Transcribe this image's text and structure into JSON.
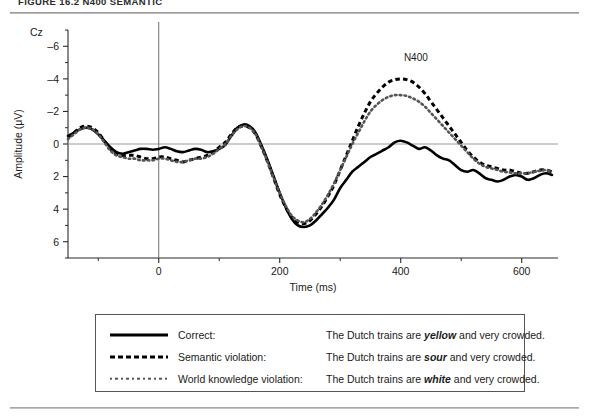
{
  "figure": {
    "caption": "FIGURE 16.2    N400 SEMANTIC",
    "channel_label": "Cz",
    "annotation": "N400"
  },
  "legend": {
    "rows": [
      {
        "style": "solid",
        "name": "Correct:",
        "sentence_pre": "The Dutch trains are ",
        "sentence_em": "yellow",
        "sentence_post": " and very crowded."
      },
      {
        "style": "dashed",
        "name": "Semantic violation:",
        "sentence_pre": "The Dutch trains are ",
        "sentence_em": "sour",
        "sentence_post": " and very crowded."
      },
      {
        "style": "dotted",
        "name": "World knowledge violation:",
        "sentence_pre": "The Dutch trains are ",
        "sentence_em": "white",
        "sentence_post": " and very crowded."
      }
    ]
  },
  "chart_data": {
    "type": "line",
    "title": "",
    "xlabel": "Time (ms)",
    "ylabel": "Amplitude (μV)",
    "xlim": [
      -150,
      660
    ],
    "ylim": [
      7,
      -7
    ],
    "y_inverted": true,
    "grid": false,
    "legend_position": "below-plot",
    "xticks": [
      0,
      200,
      400,
      600
    ],
    "xticks_minor": [
      -100,
      100,
      300,
      500
    ],
    "yticks": [
      -6,
      -4,
      -2,
      0,
      2,
      4,
      6
    ],
    "yticks_minor": [
      -7,
      -5,
      -3,
      -1,
      1,
      3,
      5,
      7
    ],
    "annotations": [
      {
        "text": "N400",
        "x": 425,
        "y": -5.1
      },
      {
        "text": "Cz",
        "x": -148,
        "y": -6.9
      }
    ],
    "zero_baseline": 0,
    "stimulus_onset_line": 0,
    "series": [
      {
        "name": "Correct",
        "style": "solid",
        "color": "#000000",
        "x": [
          -150,
          -140,
          -130,
          -120,
          -110,
          -100,
          -90,
          -80,
          -70,
          -60,
          -50,
          -40,
          -30,
          -20,
          -10,
          0,
          10,
          20,
          30,
          40,
          50,
          60,
          70,
          80,
          90,
          100,
          110,
          120,
          130,
          140,
          150,
          160,
          170,
          180,
          190,
          200,
          210,
          220,
          230,
          240,
          250,
          260,
          270,
          280,
          290,
          300,
          310,
          320,
          330,
          340,
          350,
          360,
          370,
          380,
          390,
          400,
          410,
          420,
          430,
          440,
          450,
          460,
          470,
          480,
          490,
          500,
          510,
          520,
          530,
          540,
          550,
          560,
          570,
          580,
          590,
          600,
          610,
          620,
          630,
          640,
          650
        ],
        "values": [
          -0.5,
          -0.7,
          -0.9,
          -1.0,
          -0.9,
          -0.6,
          -0.2,
          0.2,
          0.5,
          0.6,
          0.5,
          0.4,
          0.3,
          0.3,
          0.35,
          0.3,
          0.2,
          0.3,
          0.45,
          0.5,
          0.4,
          0.3,
          0.35,
          0.5,
          0.45,
          0.3,
          0.05,
          -0.5,
          -1.0,
          -1.2,
          -1.1,
          -0.7,
          0.1,
          1.0,
          2.0,
          3.0,
          3.9,
          4.6,
          5.0,
          5.1,
          5.0,
          4.7,
          4.3,
          3.9,
          3.4,
          2.7,
          2.2,
          1.7,
          1.4,
          1.1,
          0.8,
          0.6,
          0.4,
          0.2,
          -0.1,
          -0.2,
          -0.1,
          0.1,
          0.3,
          0.2,
          0.4,
          0.7,
          0.9,
          1.0,
          1.3,
          1.6,
          1.7,
          1.6,
          1.8,
          2.1,
          2.2,
          2.3,
          2.2,
          2.0,
          1.9,
          2.0,
          2.2,
          2.1,
          1.9,
          1.8,
          1.9
        ]
      },
      {
        "name": "Semantic violation",
        "style": "dashed",
        "color": "#000000",
        "x": [
          -150,
          -140,
          -130,
          -120,
          -110,
          -100,
          -90,
          -80,
          -70,
          -60,
          -50,
          -40,
          -30,
          -20,
          -10,
          0,
          10,
          20,
          30,
          40,
          50,
          60,
          70,
          80,
          90,
          100,
          110,
          120,
          130,
          140,
          150,
          160,
          170,
          180,
          190,
          200,
          210,
          220,
          230,
          240,
          250,
          260,
          270,
          280,
          290,
          300,
          310,
          320,
          330,
          340,
          350,
          360,
          370,
          380,
          390,
          400,
          410,
          420,
          430,
          440,
          450,
          460,
          470,
          480,
          490,
          500,
          510,
          520,
          530,
          540,
          550,
          560,
          570,
          580,
          590,
          600,
          610,
          620,
          630,
          640,
          650
        ],
        "values": [
          -0.4,
          -0.7,
          -1.0,
          -1.1,
          -1.0,
          -0.7,
          -0.2,
          0.3,
          0.6,
          0.7,
          0.7,
          0.7,
          0.8,
          0.9,
          0.9,
          0.8,
          0.8,
          0.9,
          1.0,
          1.1,
          1.0,
          0.9,
          0.8,
          0.7,
          0.5,
          0.2,
          -0.1,
          -0.6,
          -1.0,
          -1.1,
          -1.0,
          -0.6,
          0.2,
          1.1,
          2.1,
          3.1,
          3.9,
          4.5,
          4.8,
          4.9,
          4.7,
          4.3,
          3.8,
          3.2,
          2.5,
          1.6,
          0.7,
          -0.2,
          -1.1,
          -1.9,
          -2.6,
          -3.1,
          -3.5,
          -3.8,
          -3.95,
          -4.0,
          -3.95,
          -3.8,
          -3.5,
          -3.1,
          -2.6,
          -2.1,
          -1.6,
          -1.1,
          -0.6,
          -0.1,
          0.4,
          0.8,
          1.1,
          1.3,
          1.4,
          1.5,
          1.6,
          1.6,
          1.7,
          1.8,
          1.8,
          1.7,
          1.6,
          1.6,
          1.7
        ]
      },
      {
        "name": "World knowledge violation",
        "style": "dotted",
        "color": "#555555",
        "x": [
          -150,
          -140,
          -130,
          -120,
          -110,
          -100,
          -90,
          -80,
          -70,
          -60,
          -50,
          -40,
          -30,
          -20,
          -10,
          0,
          10,
          20,
          30,
          40,
          50,
          60,
          70,
          80,
          90,
          100,
          110,
          120,
          130,
          140,
          150,
          160,
          170,
          180,
          190,
          200,
          210,
          220,
          230,
          240,
          250,
          260,
          270,
          280,
          290,
          300,
          310,
          320,
          330,
          340,
          350,
          360,
          370,
          380,
          390,
          400,
          410,
          420,
          430,
          440,
          450,
          460,
          470,
          480,
          490,
          500,
          510,
          520,
          530,
          540,
          550,
          560,
          570,
          580,
          590,
          600,
          610,
          620,
          630,
          640,
          650
        ],
        "values": [
          -0.3,
          -0.6,
          -0.9,
          -1.0,
          -0.9,
          -0.6,
          -0.1,
          0.4,
          0.7,
          0.8,
          0.9,
          0.9,
          1.0,
          1.0,
          1.0,
          0.9,
          0.9,
          1.0,
          1.1,
          1.1,
          1.0,
          0.9,
          0.9,
          0.8,
          0.6,
          0.3,
          0.0,
          -0.5,
          -0.9,
          -1.1,
          -1.0,
          -0.6,
          0.2,
          1.1,
          2.1,
          3.0,
          3.8,
          4.4,
          4.7,
          4.8,
          4.6,
          4.2,
          3.7,
          3.1,
          2.4,
          1.6,
          0.8,
          0.0,
          -0.7,
          -1.4,
          -2.0,
          -2.4,
          -2.7,
          -2.9,
          -3.0,
          -3.0,
          -2.95,
          -2.8,
          -2.6,
          -2.3,
          -1.9,
          -1.5,
          -1.1,
          -0.7,
          -0.3,
          0.1,
          0.5,
          0.9,
          1.2,
          1.4,
          1.5,
          1.6,
          1.7,
          1.75,
          1.8,
          1.8,
          1.8,
          1.7,
          1.65,
          1.6,
          1.7
        ]
      }
    ]
  }
}
